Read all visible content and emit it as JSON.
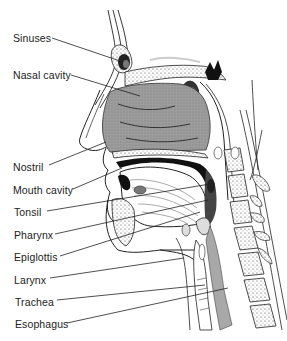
{
  "figure": {
    "labels": [
      {
        "id": "sinuses",
        "text": "Sinuses",
        "x": 13,
        "y": 32,
        "line": [
          52,
          38,
          123,
          62
        ]
      },
      {
        "id": "nasal-cavity",
        "text": "Nasal cavity",
        "x": 13,
        "y": 69,
        "line": [
          71,
          75,
          140,
          96
        ]
      },
      {
        "id": "nostril",
        "text": "Nostril",
        "x": 13,
        "y": 161,
        "line": [
          49,
          165,
          106,
          142
        ]
      },
      {
        "id": "mouth-cavity",
        "text": "Mouth cavity",
        "x": 13,
        "y": 184,
        "line": [
          73,
          189,
          122,
          168
        ]
      },
      {
        "id": "tonsil",
        "text": "Tonsil",
        "x": 14,
        "y": 206,
        "line": [
          47,
          211,
          210,
          184
        ]
      },
      {
        "id": "pharynx",
        "text": "Pharynx",
        "x": 14,
        "y": 229,
        "line": [
          55,
          234,
          208,
          200
        ]
      },
      {
        "id": "epiglottis",
        "text": "Epiglottis",
        "x": 14,
        "y": 251,
        "line": [
          60,
          256,
          200,
          212
        ]
      },
      {
        "id": "larynx",
        "text": "Larynx",
        "x": 14,
        "y": 274,
        "line": [
          50,
          278,
          184,
          258
        ]
      },
      {
        "id": "trachea",
        "text": "Trachea",
        "x": 15,
        "y": 296,
        "line": [
          57,
          300,
          205,
          285
        ]
      },
      {
        "id": "esophagus",
        "text": "Esophagus",
        "x": 15,
        "y": 318,
        "line": [
          67,
          323,
          228,
          288
        ]
      }
    ]
  },
  "colors": {
    "background": "#ffffff",
    "ink": "#222222",
    "tissue_gray": "#9a9a9a",
    "light_gray": "#c8c8c8",
    "dark": "#111111"
  }
}
